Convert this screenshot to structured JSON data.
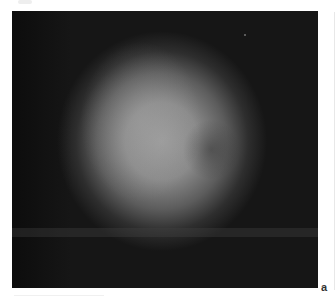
{
  "figure": {
    "panel_label": "a",
    "image": {
      "description": "grayscale blurred circular bright spot on dark background",
      "background_color": "#161616",
      "spot_color": "#9a9a9a"
    }
  }
}
